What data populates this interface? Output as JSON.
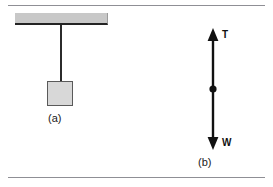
{
  "figure": {
    "background_color": "#ffffff",
    "rule_color": "#8f8f95"
  },
  "panel_a": {
    "caption": "(a)",
    "ceiling": {
      "name": "ceiling-support",
      "fill_color": "#c8c8c8",
      "edge_color": "#242424"
    },
    "string": {
      "name": "string",
      "color": "#2b2b2b"
    },
    "block": {
      "name": "hanging-block",
      "fill_color": "#d8d8d8",
      "edge_color": "#5a5a5a"
    }
  },
  "panel_b": {
    "caption": "(b)",
    "arrow_color": "#111111",
    "point_mass_color": "#111111",
    "forces": [
      {
        "symbol": "T",
        "name": "tension-force",
        "direction": "up"
      },
      {
        "symbol": "W",
        "name": "weight-force",
        "direction": "down"
      }
    ]
  }
}
